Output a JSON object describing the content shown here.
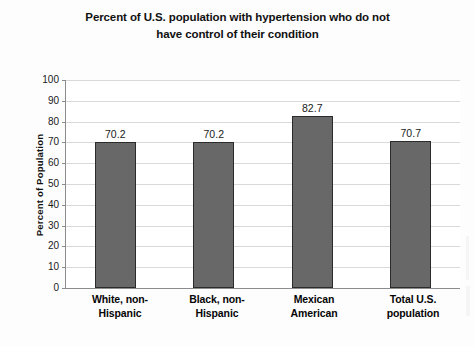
{
  "chart_data": {
    "type": "bar",
    "title": "Percent of U.S. population with hypertension who do not have control of their condition",
    "title_lines": [
      "Percent of U.S. population with hypertension who do not",
      "have control of their condition"
    ],
    "categories": [
      "White, non-Hispanic",
      "Black, non-Hispanic",
      "Mexican American",
      "Total U.S. population"
    ],
    "category_lines": [
      [
        "White, non-",
        "Hispanic"
      ],
      [
        "Black, non-",
        "Hispanic"
      ],
      [
        "Mexican",
        "American"
      ],
      [
        "Total U.S.",
        "population"
      ]
    ],
    "values": [
      70.2,
      70.2,
      82.7,
      70.7
    ],
    "value_labels": [
      "70.2",
      "70.2",
      "82.7",
      "70.7"
    ],
    "xlabel": "",
    "ylabel": "Percent of Population",
    "ylim": [
      0,
      100
    ],
    "ytick_labels": [
      "100",
      "90",
      "80",
      "70",
      "60",
      "50",
      "40",
      "30",
      "20",
      "10",
      "0"
    ],
    "ytick_values": [
      100,
      90,
      80,
      70,
      60,
      50,
      40,
      30,
      20,
      10,
      0
    ],
    "ytick_step": 10,
    "grid": true,
    "legend": false,
    "legend_position": "none",
    "colors": {
      "bar_fill": "#686868",
      "bar_border": "#2b2b2b",
      "gridline": "#d9d9d9",
      "axis": "#8c8c8c",
      "background": "#fdfdfd",
      "plot_background": "#ffffff",
      "text": "#111111"
    }
  }
}
